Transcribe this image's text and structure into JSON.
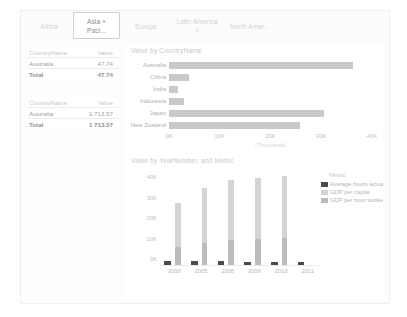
{
  "report": {
    "tabs": [
      {
        "label": "Africa",
        "selected": false
      },
      {
        "label": "Asia + Paci...",
        "selected": true
      },
      {
        "label": "Europe",
        "selected": false
      },
      {
        "label": "Latin America +",
        "selected": false
      },
      {
        "label": "North Amer...",
        "selected": false
      }
    ]
  },
  "matrix_top": {
    "columns": [
      "CountryName",
      "Value"
    ],
    "rows": [
      {
        "country": "Australia",
        "value": "47.74"
      }
    ],
    "total": {
      "label": "Total",
      "value": "47.74"
    }
  },
  "matrix_bottom": {
    "columns": [
      "CountryName",
      "Value"
    ],
    "rows": [
      {
        "country": "Australia",
        "value": "1 713.57"
      }
    ],
    "total": {
      "label": "Total",
      "value": "1 713.57"
    }
  },
  "legend": {
    "title": "Metric",
    "items": [
      {
        "label": "Average hours actually",
        "color": "#4a4a4a"
      },
      {
        "label": "GDP per capita",
        "color": "#d4d4d4"
      },
      {
        "label": "GDP per hour worked",
        "color": "#bcbcbc"
      }
    ]
  },
  "chart_data": [
    {
      "type": "bar",
      "orientation": "horizontal",
      "title": "Value by CountryName",
      "xlabel": "(Thousands)",
      "ylabel": "",
      "categories": [
        "Australia",
        "China",
        "India",
        "Indonesia",
        "Japan",
        "New Zealand"
      ],
      "values": [
        36200,
        3900,
        1800,
        2900,
        30500,
        25800
      ],
      "tick_labels": [
        "0K",
        "10K",
        "20K",
        "30K",
        "40K"
      ],
      "ticks": [
        0,
        10000,
        20000,
        30000,
        40000
      ],
      "xlim": [
        0,
        40000
      ],
      "grid": false,
      "bar_color": "#c9c9c9"
    },
    {
      "type": "bar",
      "orientation": "vertical",
      "stacked": true,
      "title": "Value by YearNumber, and Metric",
      "xlabel": "",
      "ylabel": "",
      "categories": [
        "2000",
        "2005",
        "2008",
        "2009",
        "2010",
        "2011"
      ],
      "tick_labels": [
        "0K",
        "10K",
        "20K",
        "30K",
        "40K"
      ],
      "ticks": [
        0,
        10000,
        20000,
        30000,
        40000
      ],
      "ylim": [
        0,
        44000
      ],
      "grid": false,
      "legend_position": "right",
      "series": [
        {
          "name": "Average hours actually",
          "color": "#4a4a4a",
          "values": [
            1780,
            1730,
            1720,
            1690,
            1690,
            1700
          ]
        },
        {
          "name": "GDP per capita",
          "color": "#d4d4d4",
          "values": [
            21500,
            26500,
            29500,
            29800,
            30500,
            0
          ]
        },
        {
          "name": "GDP per hour worked",
          "color": "#bcbcbc",
          "values": [
            8800,
            11000,
            12300,
            12600,
            13000,
            0
          ]
        }
      ]
    }
  ]
}
